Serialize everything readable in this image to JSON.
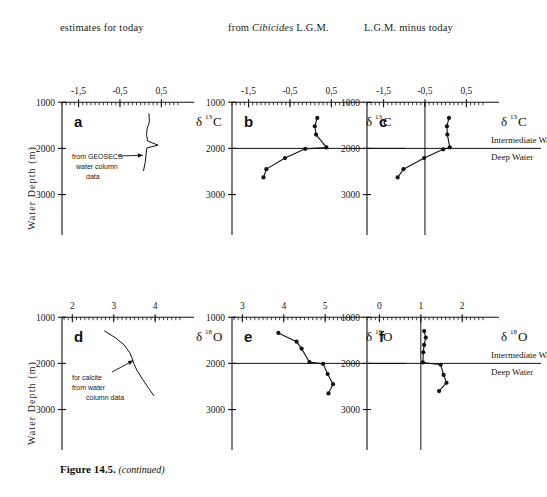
{
  "figure": {
    "caption_main": "Figure 14.5.",
    "caption_cont": "(continued)",
    "y_axis_label": "Water Depth (m)",
    "depth_ticks": [
      1000,
      2000,
      3000
    ],
    "depth_range": [
      800,
      3400
    ],
    "boundary_depth": 2000,
    "water_mass_labels": {
      "intermediate": "Intermediate Water",
      "deep": "Deep Water"
    },
    "colors": {
      "ink": "#111111",
      "line": "#1a1a1a",
      "paper": "#ffffff"
    }
  },
  "column_headers": [
    {
      "id": "col-today",
      "pre": "estimates for  today",
      "ital": "",
      "post": ""
    },
    {
      "id": "col-cibicides",
      "pre": "from ",
      "ital": "Cibicides",
      "post": " L.G.M."
    },
    {
      "id": "col-difference",
      "pre": "L.G.M. minus today",
      "ital": "",
      "post": ""
    }
  ],
  "annotations": {
    "geosecs": [
      "from GEOSECS",
      "water column",
      "data"
    ],
    "calcite": [
      "for calcite",
      "from water",
      "column  data"
    ]
  },
  "chart_data": [
    {
      "id": "a",
      "panel_label": "a",
      "type": "line",
      "title": "estimates for today",
      "xlabel": "δ13C",
      "delta_symbol": "δ",
      "iso_sup": "13",
      "iso_el": "C",
      "ylabel": "Water Depth (m)",
      "xlim": [
        -1.9,
        0.95
      ],
      "ylim": [
        800,
        3400
      ],
      "xticks": [
        -1.5,
        -0.5,
        0.5
      ],
      "xtick_labels": [
        "-1,5",
        "-0,5",
        "0,5"
      ],
      "yticks": [
        1000,
        2000,
        3000
      ],
      "grid": false,
      "has_boundary_line": false,
      "series_kind": "smooth-profile",
      "x": [
        0.2,
        0.21,
        0.16,
        0.14,
        0.17,
        0.42,
        0.15,
        0.13,
        0.11,
        0.07
      ],
      "depth": [
        1250,
        1430,
        1560,
        1700,
        1840,
        1930,
        1990,
        2130,
        2300,
        2480
      ],
      "markers": false
    },
    {
      "id": "b",
      "panel_label": "b",
      "type": "line",
      "title": "from Cibicides L.G.M.",
      "xlabel": "δ13C",
      "delta_symbol": "δ",
      "iso_sup": "13",
      "iso_el": "C",
      "xlim": [
        -1.9,
        0.95
      ],
      "ylim": [
        800,
        3400
      ],
      "xticks": [
        -1.5,
        -0.5,
        0.5
      ],
      "xtick_labels": [
        "-1,5",
        "-0,5",
        "0,5"
      ],
      "yticks": [
        1000,
        2000,
        3000
      ],
      "grid": false,
      "has_boundary_line": true,
      "series_kind": "markers-line",
      "x": [
        0.16,
        0.1,
        0.13,
        0.38,
        -0.13,
        -0.62,
        -1.07,
        -1.14
      ],
      "depth": [
        1340,
        1520,
        1700,
        1980,
        2010,
        2210,
        2450,
        2630
      ],
      "markers": true
    },
    {
      "id": "c",
      "panel_label": "c",
      "type": "line",
      "title": "L.G.M. minus today",
      "xlabel": "δ13C",
      "delta_symbol": "δ",
      "iso_sup": "13",
      "iso_el": "C",
      "xlim": [
        -1.9,
        0.95
      ],
      "ylim": [
        800,
        3400
      ],
      "xticks": [
        -1.5,
        -0.5,
        0.5
      ],
      "xtick_labels": [
        "-1,5",
        "-0,5",
        "0,5"
      ],
      "yticks": [
        1000,
        2000,
        3000
      ],
      "grid": false,
      "has_boundary_line": true,
      "reference_line_x": -0.5,
      "series_kind": "markers-line",
      "x": [
        0.08,
        0.03,
        0.04,
        0.1,
        -0.06,
        -0.52,
        -1.02,
        -1.16
      ],
      "depth": [
        1340,
        1520,
        1700,
        1980,
        2020,
        2210,
        2450,
        2630
      ],
      "markers": true
    },
    {
      "id": "d",
      "panel_label": "d",
      "type": "line",
      "title": "estimates for today",
      "xlabel": "δ18O",
      "delta_symbol": "δ",
      "iso_sup": "18",
      "iso_el": "O",
      "xlim": [
        1.75,
        4.6
      ],
      "ylim": [
        800,
        3400
      ],
      "xticks": [
        2,
        3,
        4
      ],
      "xtick_labels": [
        "2",
        "3",
        "4"
      ],
      "yticks": [
        1000,
        2000,
        3000
      ],
      "grid": false,
      "has_boundary_line": false,
      "series_kind": "smooth-profile",
      "x": [
        2.78,
        3.05,
        3.25,
        3.38,
        3.45,
        3.48,
        3.56,
        3.7,
        3.85,
        3.97
      ],
      "depth": [
        1300,
        1450,
        1600,
        1760,
        1900,
        2000,
        2150,
        2350,
        2550,
        2700
      ],
      "markers": false
    },
    {
      "id": "e",
      "panel_label": "e",
      "type": "line",
      "title": "from Cibicides L.G.M.",
      "xlabel": "δ18O",
      "delta_symbol": "δ",
      "iso_sup": "18",
      "iso_el": "O",
      "xlim": [
        2.75,
        5.6
      ],
      "ylim": [
        800,
        3400
      ],
      "xticks": [
        3,
        4,
        5
      ],
      "xtick_labels": [
        "3",
        "4",
        "5"
      ],
      "yticks": [
        1000,
        2000,
        3000
      ],
      "grid": false,
      "has_boundary_line": true,
      "series_kind": "markers-line",
      "x": [
        3.87,
        4.31,
        4.43,
        4.62,
        4.95,
        5.06,
        5.19,
        5.08
      ],
      "depth": [
        1340,
        1530,
        1680,
        1970,
        2010,
        2230,
        2450,
        2650
      ],
      "markers": true
    },
    {
      "id": "f",
      "panel_label": "f",
      "type": "line",
      "title": "L.G.M. minus today",
      "xlabel": "δ18O",
      "delta_symbol": "δ",
      "iso_sup": "18",
      "iso_el": "O",
      "xlim": [
        -0.3,
        2.55
      ],
      "ylim": [
        800,
        3400
      ],
      "xticks": [
        0,
        1,
        2
      ],
      "xtick_labels": [
        "0",
        "1",
        "2"
      ],
      "yticks": [
        1000,
        2000,
        3000
      ],
      "grid": false,
      "has_boundary_line": true,
      "reference_line_x": 1.0,
      "series_kind": "markers-line",
      "x": [
        1.08,
        1.12,
        1.08,
        1.06,
        1.05,
        1.48,
        1.55,
        1.62,
        1.44
      ],
      "depth": [
        1300,
        1440,
        1600,
        1760,
        1980,
        2030,
        2250,
        2420,
        2600
      ],
      "markers": true
    }
  ]
}
